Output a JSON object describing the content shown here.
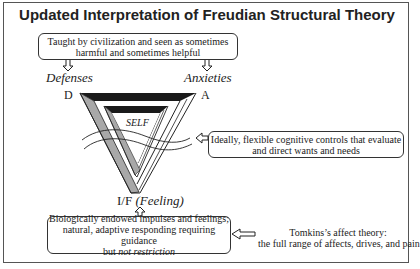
{
  "title": "Updated Interpretation of Freudian Structural Theory",
  "top_box": {
    "line1": "Taught by civilization and seen as sometimes",
    "line2": "harmful and sometimes helpful"
  },
  "labels": {
    "defenses": "Defenses",
    "anxieties": "Anxieties",
    "d": "D",
    "a": "A",
    "self": "SELF",
    "if_prefix": "I/F ",
    "if_feeling": "(Feeling)"
  },
  "right_box": {
    "line1": "Ideally, flexible cognitive controls that evaluate",
    "line2": "and direct wants and needs"
  },
  "bottom_box": {
    "line1": "Biologically endowed impulses and feelings;",
    "line2": "natural, adaptive responding requiring guidance",
    "line3_plain": "but ",
    "line3_italic": "not restriction"
  },
  "tomkins": {
    "line1": "Tomkins’s affect theory:",
    "line2": "the full range of affects, drives, and pain"
  },
  "colors": {
    "dark_band": "#1a1a1a",
    "gray_band": "#a8a8a8",
    "outline": "#222222"
  }
}
